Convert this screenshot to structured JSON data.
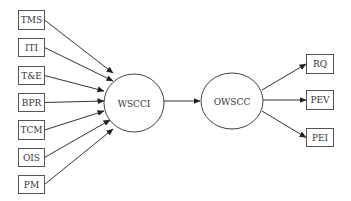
{
  "diagram": {
    "type": "flow",
    "inputs": [
      {
        "id": "tms",
        "label": "TMS",
        "x": 18,
        "y": 10,
        "w": 26,
        "h": 19,
        "to": [
          113,
          73
        ]
      },
      {
        "id": "iti",
        "label": "ITI",
        "x": 18,
        "y": 38,
        "w": 26,
        "h": 18,
        "to": [
          113,
          81
        ]
      },
      {
        "id": "te",
        "label": "T&E",
        "x": 18,
        "y": 66,
        "w": 26,
        "h": 18,
        "to": [
          104,
          91
        ]
      },
      {
        "id": "bpr",
        "label": "BPR",
        "x": 18,
        "y": 93,
        "w": 26,
        "h": 18,
        "to": [
          104,
          101
        ]
      },
      {
        "id": "tcm",
        "label": "TCM",
        "x": 18,
        "y": 120,
        "w": 26,
        "h": 19,
        "to": [
          104,
          111
        ]
      },
      {
        "id": "ois",
        "label": "OIS",
        "x": 18,
        "y": 148,
        "w": 26,
        "h": 18,
        "to": [
          110,
          120
        ]
      },
      {
        "id": "pm",
        "label": "PM",
        "x": 18,
        "y": 175,
        "w": 26,
        "h": 18,
        "to": [
          113,
          129
        ]
      }
    ],
    "center_nodes": [
      {
        "id": "wscci",
        "label": "WSCCI",
        "cx": 134,
        "cy": 103,
        "rx": 30,
        "ry": 29
      },
      {
        "id": "owscc",
        "label": "OWSCC",
        "cx": 232,
        "cy": 101,
        "rx": 31,
        "ry": 28
      }
    ],
    "center_edge": {
      "from": "wscci",
      "to": "owscc",
      "x1": 164,
      "y1": 101,
      "x2": 200,
      "y2": 101
    },
    "outputs": [
      {
        "id": "rq",
        "label": "RQ",
        "x": 306,
        "y": 54,
        "w": 27,
        "h": 19,
        "from": [
          262,
          90
        ]
      },
      {
        "id": "pev",
        "label": "PEV",
        "x": 306,
        "y": 90,
        "w": 27,
        "h": 19,
        "from": [
          263,
          100
        ]
      },
      {
        "id": "pei",
        "label": "PEI",
        "x": 306,
        "y": 128,
        "w": 27,
        "h": 18,
        "from": [
          262,
          111
        ]
      }
    ]
  }
}
